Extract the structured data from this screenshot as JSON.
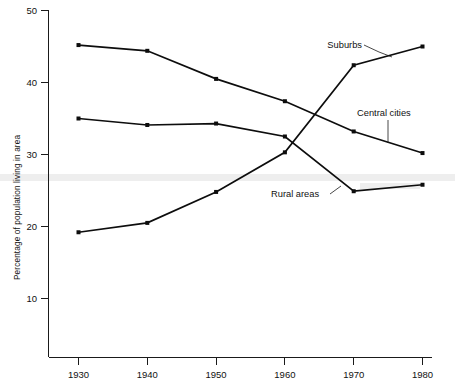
{
  "chart_data": {
    "type": "line",
    "title": "",
    "xlabel": "",
    "ylabel": "Percentage of population living in area",
    "x": [
      1930,
      1940,
      1950,
      1960,
      1970,
      1980
    ],
    "xticklabels": [
      "1930",
      "1940",
      "1950",
      "1960",
      "1970",
      "1980"
    ],
    "yticks": [
      10,
      20,
      30,
      40,
      50
    ],
    "yticklabels": [
      "10",
      "20",
      "30",
      "40",
      "50"
    ],
    "xlim": [
      1925,
      1983
    ],
    "ylim": [
      0,
      50
    ],
    "grid": false,
    "legend_position": "inline-annotations",
    "series": [
      {
        "name": "Central cities",
        "values": [
          45.2,
          44.4,
          40.5,
          37.4,
          33.2,
          30.2
        ],
        "label": "Central cities"
      },
      {
        "name": "Rural areas",
        "values": [
          35.0,
          34.1,
          34.3,
          32.5,
          24.9,
          25.8
        ],
        "label": "Rural areas"
      },
      {
        "name": "Suburbs",
        "values": [
          19.2,
          20.5,
          24.8,
          30.3,
          42.4,
          45.0
        ],
        "label": "Suburbs"
      }
    ],
    "annotations": [
      {
        "text": "Suburbs",
        "id": "suburbs"
      },
      {
        "text": "Central cities",
        "id": "central-cities"
      },
      {
        "text": "Rural areas",
        "id": "rural-areas"
      }
    ]
  },
  "axes": {
    "y_title": "Percentage of population living in area",
    "y_tick_50": "50",
    "y_tick_40": "40",
    "y_tick_30": "30",
    "y_tick_20": "20",
    "y_tick_10": "10",
    "x_tick_1930": "1930",
    "x_tick_1940": "1940",
    "x_tick_1950": "1950",
    "x_tick_1960": "1960",
    "x_tick_1970": "1970",
    "x_tick_1980": "1980"
  },
  "labels": {
    "suburbs": "Suburbs",
    "central_cities": "Central cities",
    "rural_areas": "Rural areas"
  },
  "colors": {
    "ink": "#0d0d0d",
    "axis": "#1a1a1a",
    "background": "#ffffff"
  }
}
